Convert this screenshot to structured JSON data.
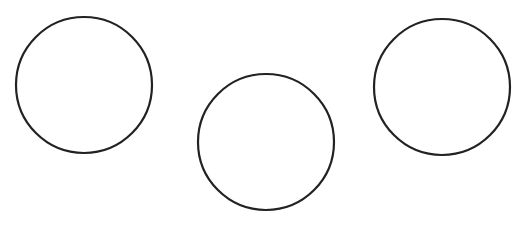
{
  "canvas": {
    "width": 520,
    "height": 225,
    "background": "#ffffff"
  },
  "style": {
    "stroke_color": "#222222",
    "stroke_width": 2.2,
    "fill_color": "#ffffff"
  },
  "circles": [
    {
      "id": "circle-left",
      "cx": 84,
      "cy": 85,
      "r": 68
    },
    {
      "id": "circle-middle",
      "cx": 266,
      "cy": 142,
      "r": 68
    },
    {
      "id": "circle-right",
      "cx": 442,
      "cy": 87,
      "r": 68
    }
  ]
}
